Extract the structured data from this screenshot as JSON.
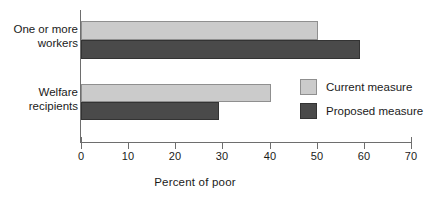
{
  "chart_data": {
    "type": "bar",
    "orientation": "horizontal",
    "title": "",
    "subtitle": "",
    "xlabel": "Percent of poor",
    "ylabel": "",
    "categories": [
      "One or more workers",
      "Welfare recipients"
    ],
    "category_lines": [
      [
        "One or more",
        "workers"
      ],
      [
        "Welfare",
        "recipients"
      ]
    ],
    "series": [
      {
        "name": "Current measure",
        "color": "#cbcbcb",
        "values": [
          50.3,
          40.2
        ]
      },
      {
        "name": "Proposed measure",
        "color": "#4a4a4a",
        "values": [
          59.2,
          29.3
        ]
      }
    ],
    "xlim": [
      0,
      70
    ],
    "xticks": [
      0,
      10,
      20,
      30,
      40,
      50,
      60,
      70
    ],
    "xtick_labels": [
      "0",
      "10",
      "20",
      "30",
      "40",
      "50",
      "60",
      "70"
    ],
    "grid": false,
    "legend_position": "middle-right",
    "legend": [
      {
        "label": "Current measure",
        "color": "#cbcbcb"
      },
      {
        "label": "Proposed measure",
        "color": "#4a4a4a"
      }
    ]
  },
  "colors": {
    "current": "#cbcbcb",
    "proposed": "#4a4a4a",
    "axis": "#6e6e6e",
    "text": "#1a1a1a",
    "background": "#ffffff"
  },
  "geometry": {
    "bars": [
      {
        "series": 0,
        "category": 0,
        "top": 21,
        "height": 19,
        "value": 50.3
      },
      {
        "series": 1,
        "category": 0,
        "top": 40,
        "height": 19,
        "value": 59.2
      },
      {
        "series": 0,
        "category": 1,
        "top": 84,
        "height": 18,
        "value": 40.2
      },
      {
        "series": 1,
        "category": 1,
        "top": 102,
        "height": 18,
        "value": 29.3
      }
    ],
    "x0": 0,
    "x_px_per_unit": 4.714
  }
}
